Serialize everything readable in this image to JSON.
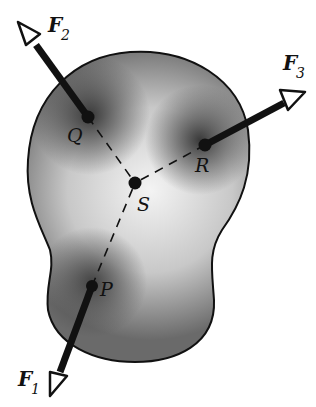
{
  "diagram": {
    "points": [
      {
        "id": "Q",
        "label": "Q",
        "x": 88,
        "y": 117
      },
      {
        "id": "R",
        "label": "R",
        "x": 205,
        "y": 145
      },
      {
        "id": "S",
        "label": "S",
        "x": 135,
        "y": 183
      },
      {
        "id": "P",
        "label": "P",
        "x": 92,
        "y": 286
      }
    ],
    "forces": [
      {
        "id": "F1",
        "label": "F",
        "sub": "1",
        "from": "P",
        "tip": [
          52,
          395
        ]
      },
      {
        "id": "F2",
        "label": "F",
        "sub": "2",
        "from": "Q",
        "tip": [
          18,
          22
        ]
      },
      {
        "id": "F3",
        "label": "F",
        "sub": "3",
        "from": "R",
        "tip": [
          305,
          92
        ]
      }
    ],
    "colors": {
      "body_dark": "#555555",
      "body_light": "#f2f2f2",
      "ink": "#111111"
    }
  }
}
